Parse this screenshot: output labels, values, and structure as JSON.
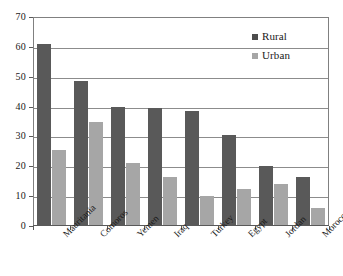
{
  "chart_data": {
    "type": "bar",
    "title": "",
    "subtitle": "",
    "xlabel": "",
    "ylabel": "",
    "ylim": [
      0,
      70
    ],
    "ytick_step": 10,
    "yticks": [
      0,
      10,
      20,
      30,
      40,
      50,
      60,
      70
    ],
    "grid": true,
    "grid_axis": "y",
    "legend_position": "top-right inside plot",
    "categories": [
      "Mauritania",
      "Comoros",
      "Yemen",
      "Iraq",
      "Turkey",
      "Egypt",
      "Jordan",
      "Morocco"
    ],
    "series": [
      {
        "name": "Rural",
        "color": "#595959",
        "values": [
          61,
          48.5,
          40,
          39.5,
          38.5,
          30.5,
          20,
          16.5
        ]
      },
      {
        "name": "Urban",
        "color": "#a6a6a6",
        "values": [
          25.5,
          35,
          21,
          16.5,
          10,
          12.5,
          14,
          6
        ]
      }
    ]
  },
  "legend": {
    "items": [
      {
        "label": "Rural",
        "color": "#4d4d4d"
      },
      {
        "label": "Urban",
        "color": "#a6a6a6"
      }
    ]
  },
  "axis": {
    "y_tick_labels": [
      "70",
      "60",
      "50",
      "40",
      "30",
      "20",
      "10",
      "0"
    ]
  }
}
